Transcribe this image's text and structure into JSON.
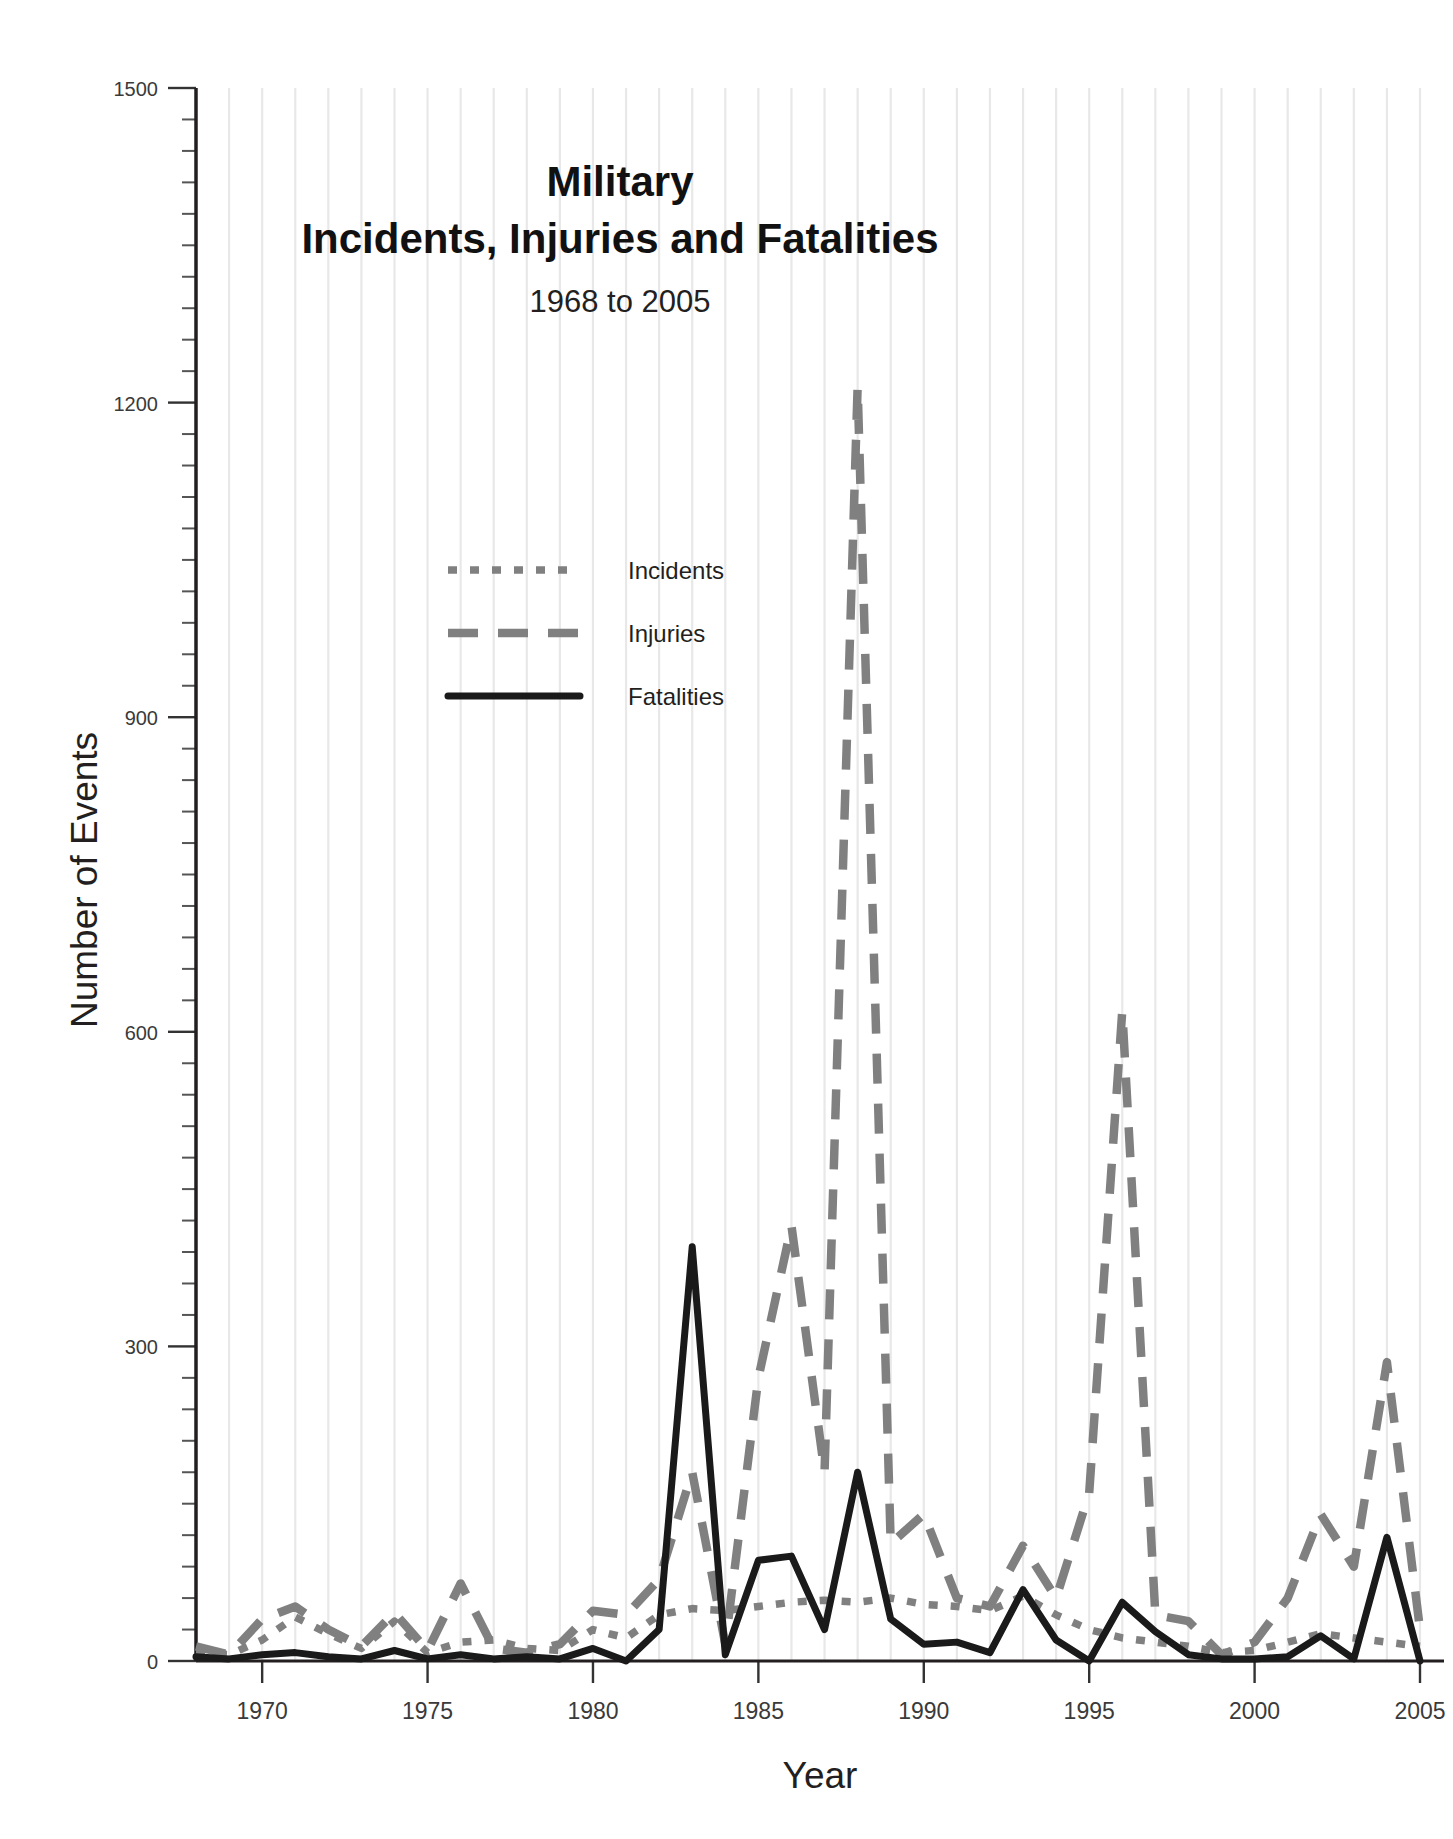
{
  "chart_data": {
    "type": "line",
    "title": "Military\nIncidents, Injuries and Fatalities",
    "title_line1": "Military",
    "title_line2": "Incidents, Injuries and Fatalities",
    "subtitle": "1968 to 2005",
    "xlabel": "Year",
    "ylabel": "Number of Events",
    "xlim": [
      1968,
      2005
    ],
    "ylim": [
      0,
      1500
    ],
    "ytick_labels": [
      "0",
      "300",
      "600",
      "900",
      "1200",
      "1500"
    ],
    "ytick_values": [
      0,
      300,
      600,
      900,
      1200,
      1500
    ],
    "yminor_step": 30,
    "xtick_labels": [
      "1970",
      "1975",
      "1980",
      "1985",
      "1990",
      "1995",
      "2000",
      "2005"
    ],
    "xtick_values": [
      1970,
      1975,
      1980,
      1985,
      1990,
      1995,
      2000,
      2005
    ],
    "grid": "vertical-minor",
    "legend_position": "upper-left-inside",
    "x": [
      1968,
      1969,
      1970,
      1971,
      1972,
      1973,
      1974,
      1975,
      1976,
      1977,
      1978,
      1979,
      1980,
      1981,
      1982,
      1983,
      1984,
      1985,
      1986,
      1987,
      1988,
      1989,
      1990,
      1991,
      1992,
      1993,
      1994,
      1995,
      1996,
      1997,
      1998,
      1999,
      2000,
      2001,
      2002,
      2003,
      2004,
      2005
    ],
    "series": [
      {
        "name": "Incidents",
        "style": "dotted",
        "color": "#808080",
        "values": [
          8,
          6,
          20,
          42,
          26,
          12,
          38,
          8,
          18,
          20,
          12,
          10,
          30,
          22,
          44,
          50,
          48,
          52,
          56,
          58,
          56,
          60,
          54,
          52,
          48,
          62,
          44,
          30,
          22,
          18,
          14,
          8,
          10,
          18,
          26,
          22,
          18,
          14
        ]
      },
      {
        "name": "Injuries",
        "style": "dashed",
        "color": "#808080",
        "values": [
          14,
          6,
          40,
          52,
          30,
          14,
          46,
          10,
          74,
          12,
          8,
          16,
          48,
          44,
          78,
          180,
          16,
          270,
          415,
          180,
          1215,
          112,
          140,
          60,
          52,
          110,
          60,
          160,
          620,
          44,
          38,
          6,
          18,
          60,
          140,
          90,
          285,
          30
        ]
      },
      {
        "name": "Fatalities",
        "style": "solid",
        "color": "#1a1a1a",
        "values": [
          4,
          2,
          6,
          8,
          4,
          2,
          10,
          2,
          6,
          2,
          4,
          2,
          12,
          0,
          30,
          395,
          6,
          96,
          100,
          30,
          180,
          40,
          16,
          18,
          8,
          68,
          20,
          0,
          56,
          28,
          6,
          2,
          2,
          4,
          24,
          2,
          118,
          0
        ]
      }
    ],
    "annotations": []
  },
  "legend": {
    "items": [
      {
        "label": "Incidents",
        "icon": "dotted-line-swatch"
      },
      {
        "label": "Injuries",
        "icon": "dashed-line-swatch"
      },
      {
        "label": "Fatalities",
        "icon": "solid-line-swatch"
      }
    ]
  },
  "colors": {
    "series_gray": "#808080",
    "series_black": "#1a1a1a",
    "gridline": "#e8e8e8",
    "axis": "#231f20",
    "background": "#ffffff"
  }
}
